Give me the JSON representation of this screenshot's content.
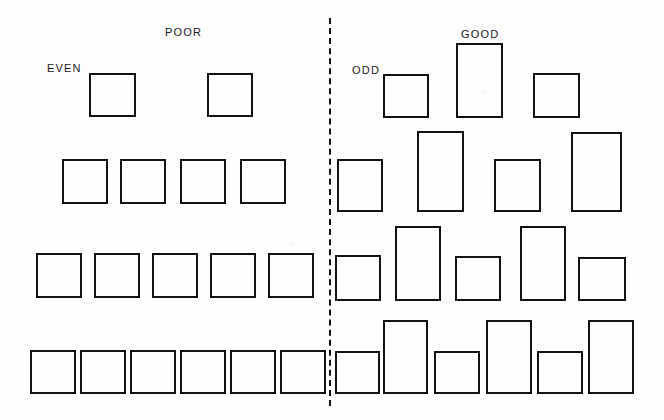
{
  "figure": {
    "width": 664,
    "height": 420,
    "background_color": "#fdfdfd",
    "stroke_color": "#121212",
    "divider": {
      "name": "vertical-dashed-divider",
      "x": 329,
      "y_top": 18,
      "y_bottom": 406,
      "style": "dashed"
    }
  },
  "captions": [
    {
      "id": "poor",
      "text": "POOR",
      "x": 165,
      "y": 26
    },
    {
      "id": "even",
      "text": "EVEN",
      "x": 47,
      "y": 62
    },
    {
      "id": "good",
      "text": "GOOD",
      "x": 461,
      "y": 28
    },
    {
      "id": "odd",
      "text": "ODD",
      "x": 352,
      "y": 64
    }
  ],
  "panels": [
    {
      "id": "left-panel",
      "label_top": "POOR",
      "label_side": "EVEN",
      "description": "uniform equal squares, evenly spaced",
      "rows": [
        {
          "id": "left-row-1",
          "count": 2,
          "boxes": [
            {
              "x": 89,
              "y": 73,
              "w": 47,
              "h": 44
            },
            {
              "x": 207,
              "y": 73,
              "w": 46,
              "h": 44
            }
          ]
        },
        {
          "id": "left-row-2",
          "count": 4,
          "boxes": [
            {
              "x": 62,
              "y": 159,
              "w": 46,
              "h": 45
            },
            {
              "x": 120,
              "y": 159,
              "w": 46,
              "h": 45
            },
            {
              "x": 180,
              "y": 159,
              "w": 46,
              "h": 45
            },
            {
              "x": 240,
              "y": 159,
              "w": 46,
              "h": 45
            }
          ]
        },
        {
          "id": "left-row-3",
          "count": 5,
          "boxes": [
            {
              "x": 36,
              "y": 253,
              "w": 46,
              "h": 45
            },
            {
              "x": 94,
              "y": 253,
              "w": 46,
              "h": 45
            },
            {
              "x": 152,
              "y": 253,
              "w": 46,
              "h": 45
            },
            {
              "x": 210,
              "y": 253,
              "w": 46,
              "h": 45
            },
            {
              "x": 268,
              "y": 253,
              "w": 46,
              "h": 45
            }
          ]
        },
        {
          "id": "left-row-4",
          "count": 6,
          "boxes": [
            {
              "x": 30,
              "y": 350,
              "w": 46,
              "h": 44
            },
            {
              "x": 80,
              "y": 350,
              "w": 46,
              "h": 44
            },
            {
              "x": 130,
              "y": 350,
              "w": 46,
              "h": 44
            },
            {
              "x": 180,
              "y": 350,
              "w": 46,
              "h": 44
            },
            {
              "x": 230,
              "y": 350,
              "w": 46,
              "h": 44
            },
            {
              "x": 280,
              "y": 350,
              "w": 46,
              "h": 44
            }
          ]
        }
      ]
    },
    {
      "id": "right-panel",
      "label_top": "GOOD",
      "label_side": "ODD",
      "description": "varied rectangle heights, irregular spacing",
      "rows": [
        {
          "id": "right-row-1",
          "count": 3,
          "boxes": [
            {
              "x": 383,
              "y": 74,
              "w": 46,
              "h": 44
            },
            {
              "x": 456,
              "y": 43,
              "w": 47,
              "h": 75
            },
            {
              "x": 533,
              "y": 73,
              "w": 47,
              "h": 45
            }
          ]
        },
        {
          "id": "right-row-2",
          "count": 4,
          "boxes": [
            {
              "x": 337,
              "y": 159,
              "w": 46,
              "h": 53
            },
            {
              "x": 417,
              "y": 131,
              "w": 47,
              "h": 81
            },
            {
              "x": 494,
              "y": 159,
              "w": 47,
              "h": 53
            },
            {
              "x": 571,
              "y": 132,
              "w": 51,
              "h": 80
            }
          ]
        },
        {
          "id": "right-row-3",
          "count": 5,
          "boxes": [
            {
              "x": 335,
              "y": 255,
              "w": 46,
              "h": 46
            },
            {
              "x": 395,
              "y": 226,
              "w": 46,
              "h": 75
            },
            {
              "x": 455,
              "y": 256,
              "w": 46,
              "h": 45
            },
            {
              "x": 520,
              "y": 226,
              "w": 46,
              "h": 75
            },
            {
              "x": 578,
              "y": 257,
              "w": 48,
              "h": 44
            }
          ]
        },
        {
          "id": "right-row-4",
          "count": 6,
          "boxes": [
            {
              "x": 335,
              "y": 351,
              "w": 45,
              "h": 43
            },
            {
              "x": 383,
              "y": 320,
              "w": 45,
              "h": 74
            },
            {
              "x": 434,
              "y": 351,
              "w": 46,
              "h": 43
            },
            {
              "x": 486,
              "y": 320,
              "w": 46,
              "h": 74
            },
            {
              "x": 537,
              "y": 351,
              "w": 46,
              "h": 43
            },
            {
              "x": 588,
              "y": 320,
              "w": 46,
              "h": 74
            }
          ]
        }
      ]
    }
  ]
}
